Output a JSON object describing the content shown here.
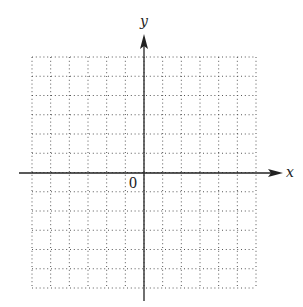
{
  "diagram": {
    "type": "coordinate-plane",
    "x_axis_label": "x",
    "y_axis_label": "y",
    "origin_label": "0",
    "grid": {
      "style": "dotted",
      "columns": 12,
      "rows": 12,
      "x_range": [
        -6,
        6
      ],
      "y_range": [
        -6,
        6
      ],
      "tick_labels_shown": false
    },
    "colors": {
      "axis": "#222222",
      "grid_dots": "#555555",
      "background": "#ffffff"
    }
  }
}
